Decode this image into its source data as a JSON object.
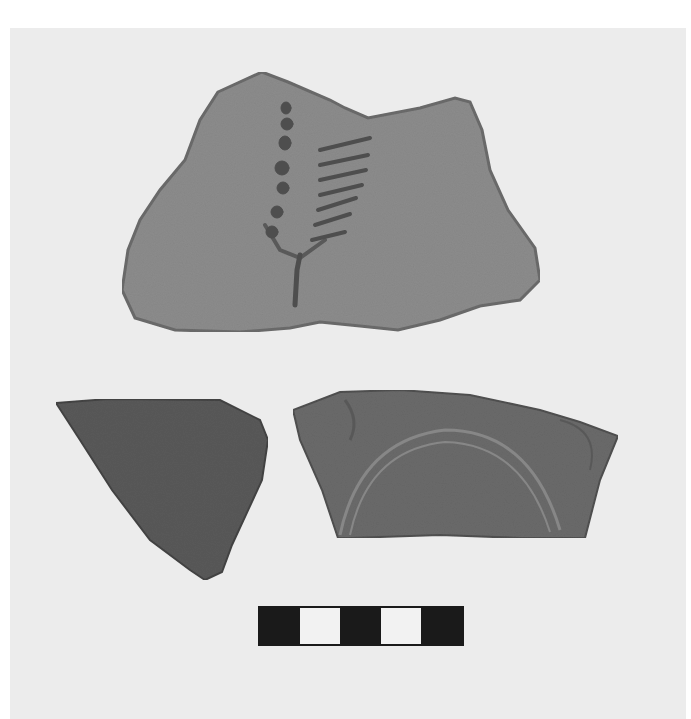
{
  "photo": {
    "subject": "Pottery sherds with scale bar",
    "background_color": "#ebebeb",
    "objects": [
      {
        "name": "sherd-top-painted-branch",
        "fill": "#8a8a8a",
        "motif_color": "#4f4f4f"
      },
      {
        "name": "sherd-bottom-left-dark",
        "fill": "#5a5a5a"
      },
      {
        "name": "sherd-bottom-right-arc",
        "fill": "#6a6a6a",
        "motif_color": "#888888"
      }
    ],
    "scale_bar": {
      "segments": [
        "black",
        "white",
        "black",
        "white",
        "black"
      ],
      "colors": {
        "black": "#1a1a1a",
        "white": "#f2f2f2"
      }
    }
  }
}
